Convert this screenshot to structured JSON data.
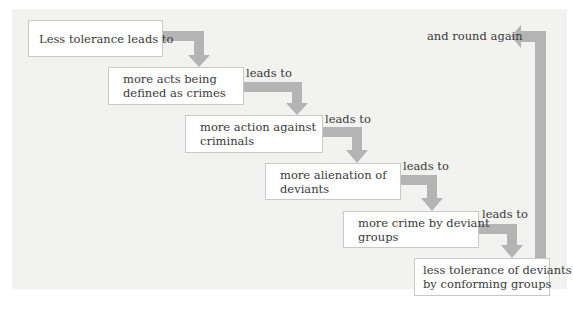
{
  "diagram": {
    "type": "cycle-flow",
    "colors": {
      "panel_background": "#f2f2f1",
      "box_background": "#ffffff",
      "box_border": "#c9c9c9",
      "arrow": "#b4b4b4",
      "text": "#3a3a3a"
    },
    "steps": [
      {
        "lines": [
          "Less tolerance leads to"
        ]
      },
      {
        "lines": [
          "more acts being",
          "defined as crimes"
        ]
      },
      {
        "lines": [
          "more action against",
          "criminals"
        ]
      },
      {
        "lines": [
          "more alienation of",
          "deviants"
        ]
      },
      {
        "lines": [
          "more crime by deviant",
          "groups"
        ]
      },
      {
        "lines": [
          "less tolerance of deviants",
          "by conforming groups"
        ]
      }
    ],
    "connector_labels": [
      "leads to",
      "leads to",
      "leads to",
      "leads to"
    ],
    "return_label": "and round again"
  }
}
